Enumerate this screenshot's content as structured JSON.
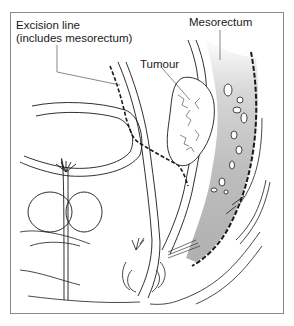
{
  "diagram": {
    "labels": {
      "excision_line_1": "Excision line",
      "excision_line_2": "(includes mesorectum)",
      "tumour": "Tumour",
      "mesorectum": "Mesorectum"
    },
    "colors": {
      "line": "#1a1a1a",
      "mesorectum_fill": "#b8b8b8",
      "mesorectum_fade": "#ffffff",
      "frame": "#8a8a8a"
    }
  }
}
